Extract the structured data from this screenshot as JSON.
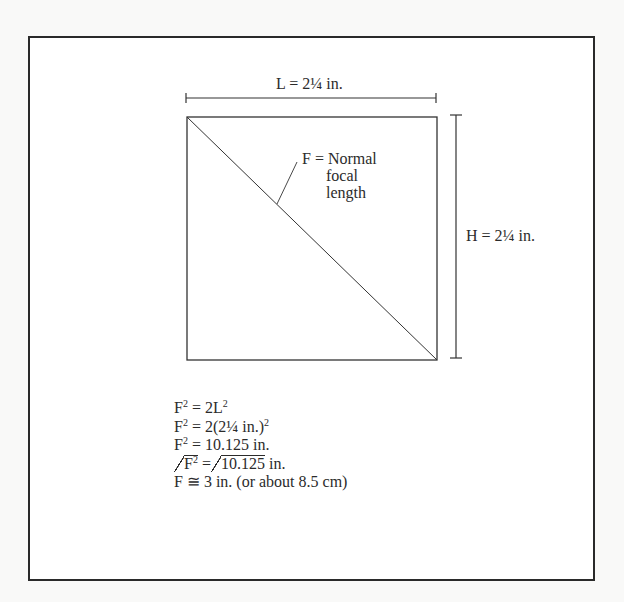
{
  "figure": {
    "width_label": "L = 2¼ in.",
    "diagonal_label": {
      "line1": "F = Normal",
      "line2": "focal",
      "line3": "length"
    },
    "height_label": "H = 2¼ in."
  },
  "equations": {
    "eq1": {
      "lhs": "F",
      "lhs_exp": "2",
      "rhs": " = 2L",
      "rhs_exp": "2"
    },
    "eq2": {
      "lhs": "F",
      "lhs_exp": "2",
      "rhs": " = 2(2¼ in.)",
      "rhs_exp": "2"
    },
    "eq3": {
      "lhs": "F",
      "lhs_exp": "2",
      "rhs": " = 10.125 in."
    },
    "eq4": {
      "root_lhs": "F",
      "root_lhs_exp": "2",
      "mid": " =",
      "root_rhs": "10.125",
      "tail": " in."
    },
    "eq5": {
      "text": "F ≅ 3 in. (or about 8.5 cm)"
    }
  },
  "colors": {
    "ink": "#2b2b2b",
    "paper": "#ffffff",
    "background": "#f9f9f8"
  }
}
